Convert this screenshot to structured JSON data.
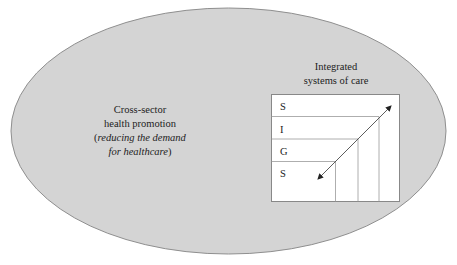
{
  "diagram": {
    "outer_ellipse": {
      "label_lines": [
        "Cross-sector",
        "health promotion"
      ],
      "label_paren": {
        "open": "(",
        "italic_1": "reducing the demand",
        "italic_2": "for healthcare",
        "close": ")"
      },
      "fill": "#d4d4d4",
      "stroke": "#8f8f8f"
    },
    "inner_box": {
      "title_lines": [
        "Integrated",
        "systems of care"
      ],
      "rows": [
        "S",
        "I",
        "G",
        "S"
      ],
      "fill": "#ffffff",
      "stroke": "#888888",
      "arrow": "bidirectional-diagonal"
    }
  }
}
